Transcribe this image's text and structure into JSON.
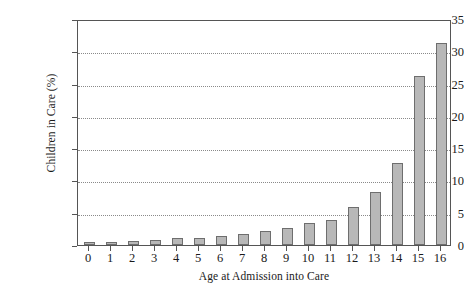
{
  "chart_data": {
    "type": "bar",
    "title": "",
    "subtitle": "",
    "xlabel": "Age at Admission into Care",
    "ylabel": "Children in Care (%)",
    "categories": [
      "0",
      "1",
      "2",
      "3",
      "4",
      "5",
      "6",
      "7",
      "8",
      "9",
      "10",
      "11",
      "12",
      "13",
      "14",
      "15",
      "16"
    ],
    "values": [
      0.4,
      0.5,
      0.6,
      0.7,
      1.1,
      1.1,
      1.4,
      1.7,
      2.2,
      2.7,
      3.4,
      3.9,
      5.9,
      8.2,
      12.7,
      26.1,
      31.3
    ],
    "ylim": [
      0,
      35
    ],
    "yticks": [
      0,
      5,
      10,
      15,
      20,
      25,
      30,
      35
    ],
    "ytick_labels": [
      "0",
      "5",
      "10",
      "15",
      "20",
      "25",
      "30",
      "35"
    ],
    "grid": true,
    "grid_axis": "y",
    "grid_style": "dotted",
    "legend": false,
    "legend_position": "none",
    "bar_fill_color": "#b8b8b8",
    "bar_edge_color": "#6e6e6e",
    "axis_color": "#555555",
    "grid_color": "#8a8a8a",
    "background_color": "#ffffff",
    "series": [
      {
        "name": "Children in Care (%)",
        "values": [
          0.4,
          0.5,
          0.6,
          0.7,
          1.1,
          1.1,
          1.4,
          1.7,
          2.2,
          2.7,
          3.4,
          3.9,
          5.9,
          8.2,
          12.7,
          26.1,
          31.3
        ]
      }
    ]
  }
}
